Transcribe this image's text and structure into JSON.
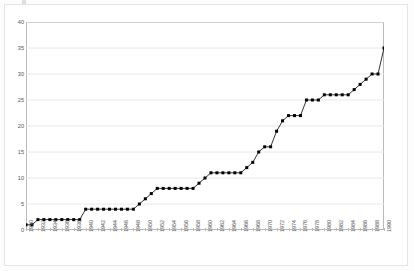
{
  "chart": {
    "title": "",
    "frame_color": "#b9b9b9",
    "grid_color": "#e8e8e8",
    "line_color": "#000000",
    "marker_color": "#000000",
    "background": "#ffffff"
  },
  "chart_data": {
    "type": "line",
    "title": "",
    "subtitle": "",
    "xlabel": "",
    "ylabel": "",
    "xlim": [
      1930,
      1990
    ],
    "ylim": [
      0,
      40
    ],
    "ytick_step": 5,
    "xtick_step": 2,
    "grid": "horizontal",
    "legend": "none",
    "markers": true,
    "marker_shape": "square",
    "yticks": [
      0,
      5,
      10,
      15,
      20,
      25,
      30,
      35,
      40
    ],
    "ytick_labels": [
      "0",
      "5",
      "10",
      "15",
      "20",
      "25",
      "30",
      "35",
      "40"
    ],
    "xticks": [
      1930,
      1932,
      1934,
      1936,
      1938,
      1940,
      1942,
      1944,
      1946,
      1948,
      1950,
      1952,
      1954,
      1956,
      1958,
      1960,
      1962,
      1964,
      1966,
      1968,
      1970,
      1972,
      1974,
      1976,
      1978,
      1980,
      1982,
      1984,
      1986,
      1988,
      1990
    ],
    "xtick_labels": [
      "1930",
      "1932",
      "1934",
      "1936",
      "1938",
      "1940",
      "1942",
      "1944",
      "1946",
      "1948",
      "1950",
      "1952",
      "1954",
      "1956",
      "1958",
      "1960",
      "1962",
      "1964",
      "1966",
      "1968",
      "1970",
      "1972",
      "1974",
      "1976",
      "1978",
      "1980",
      "1982",
      "1984",
      "1986",
      "1988",
      "1990"
    ],
    "x": [
      1930,
      1931,
      1932,
      1933,
      1934,
      1935,
      1936,
      1937,
      1938,
      1939,
      1940,
      1941,
      1942,
      1943,
      1944,
      1945,
      1946,
      1947,
      1948,
      1949,
      1950,
      1951,
      1952,
      1953,
      1954,
      1955,
      1956,
      1957,
      1958,
      1959,
      1960,
      1961,
      1962,
      1963,
      1964,
      1965,
      1966,
      1967,
      1968,
      1969,
      1970,
      1971,
      1972,
      1973,
      1974,
      1975,
      1976,
      1977,
      1978,
      1979,
      1980,
      1981,
      1982,
      1983,
      1984,
      1985,
      1986,
      1987,
      1988,
      1989,
      1990
    ],
    "values": [
      1,
      1,
      2,
      2,
      2,
      2,
      2,
      2,
      2,
      2,
      4,
      4,
      4,
      4,
      4,
      4,
      4,
      4,
      4,
      5,
      6,
      7,
      8,
      8,
      8,
      8,
      8,
      8,
      8,
      9,
      10,
      11,
      11,
      11,
      11,
      11,
      11,
      12,
      13,
      15,
      16,
      16,
      19,
      21,
      22,
      22,
      22,
      25,
      25,
      25,
      26,
      26,
      26,
      26,
      26,
      27,
      28,
      29,
      30,
      30,
      35
    ],
    "series": [
      {
        "name": "series-1",
        "values": [
          1,
          1,
          2,
          2,
          2,
          2,
          2,
          2,
          2,
          2,
          4,
          4,
          4,
          4,
          4,
          4,
          4,
          4,
          4,
          5,
          6,
          7,
          8,
          8,
          8,
          8,
          8,
          8,
          8,
          9,
          10,
          11,
          11,
          11,
          11,
          11,
          11,
          12,
          13,
          15,
          16,
          16,
          19,
          21,
          22,
          22,
          22,
          25,
          25,
          25,
          26,
          26,
          26,
          26,
          26,
          27,
          28,
          29,
          30,
          30,
          35
        ]
      }
    ]
  }
}
